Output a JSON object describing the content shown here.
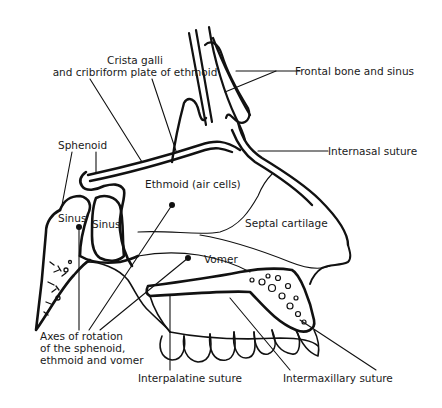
{
  "diagram": {
    "colors": {
      "ink": "#111111",
      "background": "#ffffff"
    },
    "labels": {
      "crista_galli_line1": "Crista galli",
      "crista_galli_line2": "and cribriform plate of ethmoid",
      "frontal": "Frontal bone and sinus",
      "sphenoid": "Sphenoid",
      "internasal": "Internasal suture",
      "ethmoid": "Ethmoid (air cells)",
      "sinus_left": "Sinus",
      "sinus_right": "Sinus",
      "septal": "Septal cartilage",
      "vomer": "Vomer",
      "axes_line1": "Axes of rotation",
      "axes_line2": "of the sphenoid,",
      "axes_line3": "ethmoid and vomer",
      "interpalatine": "Interpalatine suture",
      "intermaxillary": "Intermaxillary suture"
    }
  }
}
